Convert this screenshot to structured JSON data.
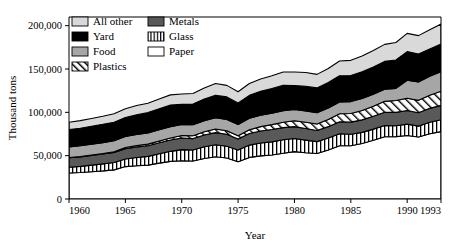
{
  "chart_data": {
    "type": "area",
    "title": "",
    "subtitle": "",
    "xlabel": "Year",
    "ylabel": "Thousand tons",
    "xlim": [
      1960,
      1993
    ],
    "ylim": [
      0,
      210000
    ],
    "grid": false,
    "stacked": true,
    "legend_position": "top-left",
    "x_ticks": [
      "1960",
      "1965",
      "1970",
      "1975",
      "1980",
      "1985",
      "1990",
      "1993"
    ],
    "x_tick_values": [
      1960,
      1965,
      1970,
      1975,
      1980,
      1985,
      1990,
      1993
    ],
    "y_ticks": [
      "0",
      "50,000",
      "100,000",
      "150,000",
      "200,000"
    ],
    "y_tick_values": [
      0,
      50000,
      100000,
      150000,
      200000
    ],
    "x": [
      1960,
      1961,
      1962,
      1963,
      1964,
      1965,
      1966,
      1967,
      1968,
      1969,
      1970,
      1971,
      1972,
      1973,
      1974,
      1975,
      1976,
      1977,
      1978,
      1979,
      1980,
      1981,
      1982,
      1983,
      1984,
      1985,
      1986,
      1987,
      1988,
      1989,
      1990,
      1991,
      1992,
      1993
    ],
    "series": [
      {
        "name": "Paper",
        "fill": "#ffffff",
        "pattern": "solid",
        "values": [
          29990,
          30500,
          31500,
          32400,
          33600,
          37400,
          38300,
          39100,
          41400,
          43400,
          44200,
          43800,
          46800,
          48700,
          47300,
          43000,
          48000,
          49800,
          50800,
          52700,
          54700,
          53400,
          52500,
          56500,
          61500,
          61500,
          64000,
          67700,
          71800,
          72000,
          73300,
          71600,
          75300,
          77800
        ]
      },
      {
        "name": "Glass",
        "fill": "#ffffff",
        "pattern": "vertical",
        "values": [
          6720,
          7150,
          7600,
          8100,
          8500,
          8700,
          9600,
          10100,
          10800,
          11600,
          12740,
          12800,
          13400,
          13900,
          13600,
          13500,
          14200,
          14800,
          15100,
          15600,
          15130,
          14500,
          13700,
          13800,
          13800,
          13200,
          12900,
          12900,
          12900,
          12600,
          13100,
          12500,
          13200,
          13700
        ]
      },
      {
        "name": "Metals",
        "fill": "#595959",
        "pattern": "solid",
        "values": [
          10820,
          11000,
          11200,
          11400,
          11700,
          11900,
          12200,
          12300,
          12600,
          13000,
          13400,
          13100,
          13600,
          14000,
          13800,
          12700,
          13400,
          13900,
          14300,
          14100,
          13700,
          13500,
          12900,
          13200,
          13900,
          14000,
          14400,
          14800,
          15300,
          15400,
          15800,
          15400,
          16100,
          16500
        ]
      },
      {
        "name": "Plastics",
        "fill": "#ffffff",
        "pattern": "diagonal",
        "values": [
          390,
          450,
          530,
          620,
          740,
          1400,
          1600,
          1800,
          2100,
          2400,
          2900,
          3200,
          3700,
          4200,
          4100,
          3700,
          4400,
          5000,
          5600,
          6200,
          6830,
          7100,
          7400,
          8200,
          9200,
          10000,
          10800,
          11700,
          12700,
          13600,
          14100,
          14300,
          15200,
          16400
        ]
      },
      {
        "name": "Food",
        "fill": "#a6a6a6",
        "pattern": "solid",
        "values": [
          12200,
          12300,
          12400,
          12500,
          12600,
          12700,
          12800,
          12850,
          12900,
          12950,
          12800,
          12700,
          12800,
          12900,
          13000,
          13000,
          13100,
          13200,
          13300,
          13400,
          13000,
          13100,
          13100,
          13300,
          13500,
          13700,
          13800,
          13900,
          14000,
          14100,
          20800,
          21300,
          21900,
          22400
        ]
      },
      {
        "name": "Yard",
        "fill": "#000000",
        "pattern": "solid",
        "values": [
          20000,
          20300,
          20700,
          21100,
          21500,
          22000,
          22800,
          23500,
          24200,
          25000,
          23200,
          23900,
          25000,
          26100,
          26000,
          25000,
          26500,
          27500,
          28300,
          29200,
          27500,
          28500,
          28600,
          29400,
          30300,
          30000,
          30800,
          31400,
          32100,
          32700,
          33000,
          32100,
          31500,
          32100
        ]
      },
      {
        "name": "All other",
        "fill": "#d9d9d9",
        "pattern": "solid",
        "values": [
          8380,
          8700,
          9000,
          9300,
          9700,
          10100,
          10500,
          10900,
          11400,
          11800,
          12000,
          12200,
          12900,
          13500,
          13300,
          12800,
          13700,
          14200,
          14800,
          15300,
          15600,
          15800,
          15600,
          16200,
          17000,
          17600,
          18200,
          18900,
          19600,
          20200,
          21000,
          21300,
          22200,
          23000
        ]
      }
    ],
    "totals_note": "Values stack bottom-to-top: Paper, Glass, Metals, Plastics, Food, Yard, All other"
  },
  "legend": {
    "column_left": [
      {
        "label": "All other",
        "swatch": "light-gray-solid"
      },
      {
        "label": "Yard",
        "swatch": "black-solid"
      },
      {
        "label": "Food",
        "swatch": "medium-gray-solid"
      },
      {
        "label": "Plastics",
        "swatch": "diagonal-hatch"
      }
    ],
    "column_right": [
      {
        "label": "Metals",
        "swatch": "dark-gray-solid"
      },
      {
        "label": "Glass",
        "swatch": "vertical-stripe"
      },
      {
        "label": "Paper",
        "swatch": "white-solid"
      }
    ]
  },
  "axes": {
    "y_title": "Thousand tons",
    "x_title": "Year"
  }
}
